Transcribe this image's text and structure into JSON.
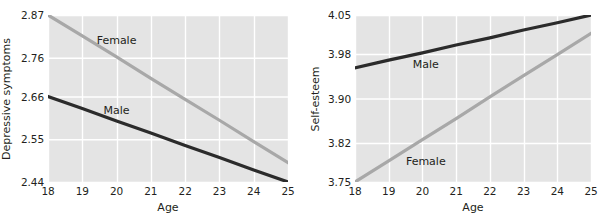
{
  "figure": {
    "background": "#ffffff",
    "panel_background": "#e4e4e4",
    "gridline_color": "#ffffff"
  },
  "chart_data": [
    {
      "type": "line",
      "title": "",
      "xlabel": "Age",
      "ylabel": "Depressive symptoms",
      "x": [
        18,
        19,
        20,
        21,
        22,
        23,
        24,
        25
      ],
      "xticklabels": [
        "18",
        "19",
        "20",
        "21",
        "22",
        "23",
        "24",
        "25"
      ],
      "xlim": [
        18,
        25
      ],
      "ylim": [
        2.44,
        2.87
      ],
      "yticks": [
        2.87,
        2.76,
        2.66,
        2.55,
        2.44
      ],
      "yticklabels": [
        "2.87",
        "2.76",
        "2.66",
        "2.55",
        "2.44"
      ],
      "grid": true,
      "legend": "inline-labels",
      "series": [
        {
          "name": "Female",
          "color": "#a8a8a8",
          "label_x": 20.0,
          "label_y": 2.805,
          "values": [
            2.87,
            2.816,
            2.762,
            2.707,
            2.653,
            2.599,
            2.544,
            2.49
          ]
        },
        {
          "name": "Male",
          "color": "#2b2b2b",
          "label_x": 20.0,
          "label_y": 2.625,
          "values": [
            2.66,
            2.629,
            2.597,
            2.566,
            2.534,
            2.503,
            2.471,
            2.44
          ]
        }
      ]
    },
    {
      "type": "line",
      "title": "",
      "xlabel": "Age",
      "ylabel": "Self-esteem",
      "x": [
        18,
        19,
        20,
        21,
        22,
        23,
        24,
        25
      ],
      "xticklabels": [
        "18",
        "19",
        "20",
        "21",
        "22",
        "23",
        "24",
        "25"
      ],
      "xlim": [
        18,
        25
      ],
      "ylim": [
        3.75,
        4.05
      ],
      "yticks": [
        4.05,
        3.98,
        3.9,
        3.82,
        3.75
      ],
      "yticklabels": [
        "4.05",
        "3.98",
        "3.90",
        "3.82",
        "3.75"
      ],
      "grid": true,
      "legend": "inline-labels",
      "series": [
        {
          "name": "Male",
          "color": "#2b2b2b",
          "label_x": 20.1,
          "label_y": 3.962,
          "values": [
            3.955,
            3.969,
            3.982,
            3.996,
            4.009,
            4.023,
            4.036,
            4.05
          ]
        },
        {
          "name": "Female",
          "color": "#a8a8a8",
          "label_x": 20.1,
          "label_y": 3.787,
          "values": [
            3.75,
            3.788,
            3.826,
            3.864,
            3.903,
            3.941,
            3.979,
            4.017
          ]
        }
      ]
    }
  ]
}
